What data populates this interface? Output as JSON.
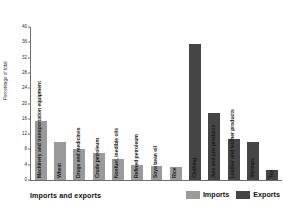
{
  "chart_data": {
    "type": "bar",
    "title": "Imports and exports",
    "xlabel": "",
    "ylabel": "Percentage of total",
    "ylim": [
      0,
      40
    ],
    "yticks": [
      0,
      4,
      8,
      12,
      16,
      20,
      24,
      28,
      32,
      36,
      40
    ],
    "grid": false,
    "legend_position": "bottom-right",
    "categories": [
      "Machinery and transportation equipment",
      "Wheat",
      "Drugs and medicines",
      "Crude petroleum",
      "Nonfuel, inedible oils",
      "Refined petroleum",
      "Soya bean oil",
      "Rice",
      "Clothing",
      "Jute and jute products",
      "Leather and leather products",
      "Shrimps",
      "Tea"
    ],
    "series": [
      {
        "name": "Imports",
        "color": "#9a9a9a",
        "values": [
          15.5,
          10.0,
          8.2,
          7.0,
          5.4,
          4.0,
          3.6,
          3.4,
          null,
          null,
          null,
          null,
          null
        ]
      },
      {
        "name": "Exports",
        "color": "#454545",
        "values": [
          null,
          null,
          null,
          null,
          null,
          null,
          null,
          null,
          35.6,
          17.4,
          10.6,
          10.0,
          2.6
        ]
      }
    ],
    "bars": [
      {
        "category": "Machinery and transportation equipment",
        "value": 15.5,
        "series": "Imports"
      },
      {
        "category": "Wheat",
        "value": 10.0,
        "series": "Imports"
      },
      {
        "category": "Drugs and medicines",
        "value": 8.2,
        "series": "Imports"
      },
      {
        "category": "Crude petroleum",
        "value": 7.0,
        "series": "Imports"
      },
      {
        "category": "Nonfuel, inedible oils",
        "value": 5.4,
        "series": "Imports"
      },
      {
        "category": "Refined petroleum",
        "value": 4.0,
        "series": "Imports"
      },
      {
        "category": "Soya bean oil",
        "value": 3.6,
        "series": "Imports"
      },
      {
        "category": "Rice",
        "value": 3.4,
        "series": "Imports"
      },
      {
        "category": "Clothing",
        "value": 35.6,
        "series": "Exports"
      },
      {
        "category": "Jute and jute products",
        "value": 17.4,
        "series": "Exports"
      },
      {
        "category": "Leather and leather products",
        "value": 10.6,
        "series": "Exports"
      },
      {
        "category": "Shrimps",
        "value": 10.0,
        "series": "Exports"
      },
      {
        "category": "Tea",
        "value": 2.6,
        "series": "Exports"
      }
    ]
  },
  "axis": {
    "y_title": "Percentage of total",
    "tick_labels": [
      "0",
      "4",
      "8",
      "12",
      "16",
      "20",
      "24",
      "28",
      "32",
      "36",
      "40"
    ]
  },
  "footer": {
    "title": "Imports and exports"
  },
  "legend": {
    "items": [
      {
        "label": "Imports",
        "color": "#9a9a9a"
      },
      {
        "label": "Exports",
        "color": "#454545"
      }
    ]
  }
}
